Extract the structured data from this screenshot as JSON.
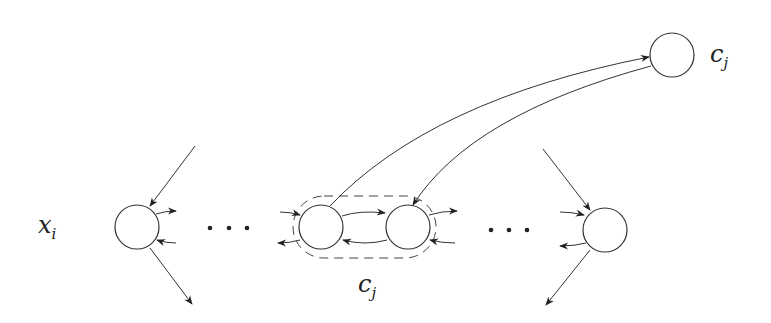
{
  "diagram": {
    "type": "graph",
    "labels": {
      "variable_node": "x",
      "variable_node_sub": "i",
      "clause_gadget": "c",
      "clause_gadget_sub": "j",
      "clause_node": "c",
      "clause_node_sub": "j"
    },
    "ellipsis": ". . .",
    "nodes": [
      {
        "id": "x_i",
        "cx": 137,
        "cy": 227
      },
      {
        "id": "gadget_left",
        "cx": 321,
        "cy": 227
      },
      {
        "id": "gadget_right",
        "cx": 408,
        "cy": 227
      },
      {
        "id": "right_node",
        "cx": 605,
        "cy": 230
      },
      {
        "id": "c_j",
        "cx": 672,
        "cy": 55
      }
    ],
    "colors": {
      "stroke": "#333333",
      "background": "#ffffff"
    }
  }
}
